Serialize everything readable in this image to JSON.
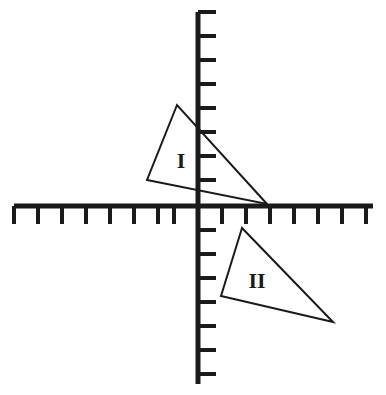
{
  "figure": {
    "type": "geometry-diagram",
    "background_color": "#ffffff",
    "ink_color": "#1a1a1a",
    "width": 386,
    "height": 395
  },
  "axes": {
    "origin": {
      "x": 198,
      "y": 206
    },
    "tick_spacing": 24,
    "stroke_width": 5,
    "tick_stroke_width": 4,
    "horizontal": {
      "name": "x-axis",
      "x_start": 14,
      "x_end": 373,
      "y": 206,
      "tick_direction": "down",
      "tick_length": 18,
      "tick_positions": [
        14,
        38,
        62,
        86,
        110,
        134,
        158,
        174,
        222,
        246,
        270,
        294,
        318,
        342,
        366
      ]
    },
    "vertical": {
      "name": "y-axis",
      "y_start": 12,
      "y_end": 384,
      "x": 198,
      "tick_direction": "right",
      "tick_length": 18,
      "tick_positions": [
        12,
        36,
        60,
        84,
        108,
        132,
        156,
        180,
        230,
        254,
        278,
        302,
        326,
        350,
        374
      ]
    }
  },
  "shapes": [
    {
      "name": "triangle-one",
      "label": "I",
      "label_position": {
        "x": 181,
        "y": 163
      },
      "label_font_size": 22,
      "vertices": [
        {
          "x": 177,
          "y": 105
        },
        {
          "x": 147,
          "y": 180
        },
        {
          "x": 267,
          "y": 204
        }
      ]
    },
    {
      "name": "triangle-two",
      "label": "II",
      "label_position": {
        "x": 257,
        "y": 283
      },
      "label_font_size": 22,
      "vertices": [
        {
          "x": 242,
          "y": 228
        },
        {
          "x": 221,
          "y": 296
        },
        {
          "x": 333,
          "y": 322
        }
      ]
    }
  ],
  "chart_data": {
    "type": "scatter",
    "xlabel": "",
    "ylabel": "",
    "grid": false,
    "legend": "none",
    "annotations": [
      "I",
      "II"
    ],
    "note": "Axis tick units are unlabeled; spacing is one unit per tick.",
    "series": [
      {
        "name": "I",
        "x": [
          -0.875,
          -2.125,
          2.875
        ],
        "y": [
          4.208,
          1.083,
          0.083
        ]
      },
      {
        "name": "II",
        "x": [
          1.833,
          0.958,
          5.625
        ],
        "y": [
          -0.917,
          -3.75,
          -4.833
        ]
      }
    ]
  }
}
